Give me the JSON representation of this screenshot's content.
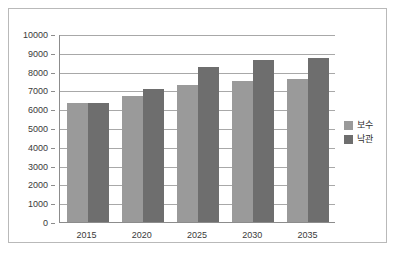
{
  "chart_data": {
    "type": "bar",
    "title": "",
    "subtitle": "",
    "xlabel": "",
    "ylabel": "",
    "categories": [
      "2015",
      "2020",
      "2025",
      "2030",
      "2035"
    ],
    "series": [
      {
        "name": "보수",
        "color": "#9a9a9a",
        "values": [
          6350,
          6700,
          7300,
          7500,
          7600
        ]
      },
      {
        "name": "낙관",
        "color": "#6e6e6e",
        "values": [
          6350,
          7050,
          8250,
          8600,
          8750
        ]
      }
    ],
    "ylim": [
      0,
      10000
    ],
    "ytick_step": 1000,
    "yticks": [
      "10000",
      "9000",
      "8000",
      "7000",
      "6000",
      "5000",
      "4000",
      "3000",
      "2000",
      "1000",
      "0"
    ],
    "grid": true,
    "grid_axis": "y",
    "legend_position": "right",
    "axis_color": "#8c8c8c",
    "grid_color": "#a8a8a8",
    "border_color": "#b9b9b9",
    "background": "#ffffff"
  },
  "legend": {
    "items": [
      {
        "label": "보수",
        "color": "#9a9a9a"
      },
      {
        "label": "낙관",
        "color": "#6e6e6e"
      }
    ]
  }
}
